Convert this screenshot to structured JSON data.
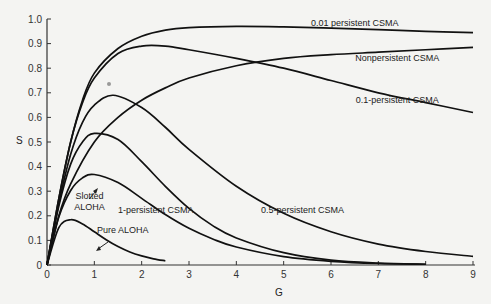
{
  "chart_data": {
    "type": "line",
    "title": "",
    "xlabel": "G",
    "ylabel": "S",
    "xlim": [
      0,
      9
    ],
    "ylim": [
      0,
      1.0
    ],
    "x_ticks": [
      "0",
      "1",
      "2",
      "3",
      "4",
      "5",
      "6",
      "7",
      "8",
      "9"
    ],
    "y_ticks": [
      "0",
      "0.1",
      "0.2",
      "0.3",
      "0.4",
      "0.5",
      "0.6",
      "0.7",
      "0.8",
      "0.9",
      "1.0"
    ],
    "grid": false,
    "legend": "inline labels",
    "series": [
      {
        "name": "Pure ALOHA",
        "x": [
          0,
          0.25,
          0.5,
          0.75,
          1,
          1.25,
          1.5,
          1.75,
          2,
          2.25,
          2.5
        ],
        "y": [
          0,
          0.152,
          0.184,
          0.167,
          0.135,
          0.103,
          0.075,
          0.053,
          0.037,
          0.025,
          0.017
        ]
      },
      {
        "name": "Slotted ALOHA",
        "x": [
          0,
          0.25,
          0.5,
          0.75,
          1,
          1.5,
          2,
          2.5,
          3,
          3.5,
          4,
          5,
          6,
          7,
          8
        ],
        "y": [
          0,
          0.195,
          0.303,
          0.354,
          0.368,
          0.335,
          0.271,
          0.205,
          0.149,
          0.106,
          0.073,
          0.034,
          0.015,
          0.006,
          0.003
        ]
      },
      {
        "name": "1-persistent CSMA",
        "x": [
          0,
          0.25,
          0.5,
          0.75,
          1,
          1.5,
          2,
          2.5,
          3,
          3.5,
          4,
          5,
          6,
          7,
          8
        ],
        "y": [
          0,
          0.24,
          0.41,
          0.5,
          0.535,
          0.51,
          0.42,
          0.32,
          0.23,
          0.16,
          0.11,
          0.05,
          0.02,
          0.008,
          0.003
        ]
      },
      {
        "name": "0.5-persistent CSMA",
        "x": [
          0,
          0.25,
          0.5,
          0.75,
          1,
          1.4,
          2,
          2.5,
          3,
          4,
          5,
          6,
          7,
          8,
          9
        ],
        "y": [
          0,
          0.25,
          0.45,
          0.58,
          0.65,
          0.69,
          0.64,
          0.56,
          0.47,
          0.32,
          0.21,
          0.135,
          0.085,
          0.055,
          0.035
        ]
      },
      {
        "name": "0.1-persistent CSMA",
        "x": [
          0,
          0.25,
          0.5,
          0.75,
          1,
          1.5,
          2,
          2.5,
          3,
          4,
          5,
          6,
          7,
          8,
          9
        ],
        "y": [
          0,
          0.27,
          0.5,
          0.66,
          0.76,
          0.86,
          0.89,
          0.89,
          0.875,
          0.84,
          0.8,
          0.75,
          0.7,
          0.66,
          0.62
        ]
      },
      {
        "name": "Nonpersistent CSMA",
        "x": [
          0,
          0.25,
          0.5,
          1,
          1.5,
          2,
          2.5,
          3,
          4,
          5,
          6,
          7,
          8,
          9
        ],
        "y": [
          0,
          0.2,
          0.33,
          0.5,
          0.6,
          0.67,
          0.72,
          0.76,
          0.81,
          0.84,
          0.855,
          0.865,
          0.875,
          0.885
        ]
      },
      {
        "name": "0.01 persistent CSMA",
        "x": [
          0,
          0.25,
          0.5,
          0.75,
          1,
          1.5,
          2,
          2.5,
          3,
          4,
          5,
          6,
          7,
          8,
          9
        ],
        "y": [
          0,
          0.27,
          0.5,
          0.67,
          0.78,
          0.88,
          0.93,
          0.955,
          0.965,
          0.97,
          0.968,
          0.963,
          0.957,
          0.95,
          0.945
        ]
      }
    ],
    "annotations": [
      {
        "text": "0.01 persistent CSMA",
        "x": 6.5,
        "y": 0.97
      },
      {
        "text": "Nonpersistent CSMA",
        "x": 7.4,
        "y": 0.83
      },
      {
        "text": "0.1-persistent CSMA",
        "x": 7.4,
        "y": 0.66
      },
      {
        "text": "0.5-persistent CSMA",
        "x": 5.4,
        "y": 0.21
      },
      {
        "text": "1-persistent CSMA",
        "x": 2.3,
        "y": 0.21
      },
      {
        "text": "Slotted ALOHA",
        "x": 0.9,
        "y": 0.27
      },
      {
        "text": "Pure ALOHA",
        "x": 1.6,
        "y": 0.13
      }
    ]
  },
  "labels": {
    "y_axis": "S",
    "x_axis": "G",
    "caption_fragment": "Fig. 3-3"
  }
}
